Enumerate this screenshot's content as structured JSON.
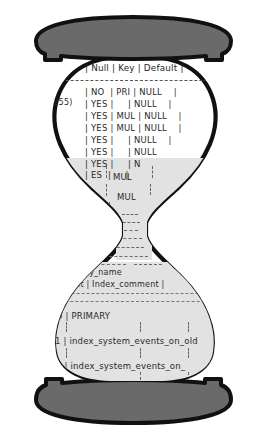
{
  "figure": {
    "colors": {
      "cap": "#6a6a6a",
      "outline": "#111111",
      "sand": "#e2e2e2",
      "background": "#ffffff",
      "text": "#2a2a2a"
    }
  },
  "top_bulb": {
    "header": "| Null | Key | Default |",
    "left_fragments": [
      ")",
      "(255)"
    ],
    "rows": [
      "| NO  | PRI | NULL    |",
      "| YES |     | NULL    |",
      "| YES | MUL | NULL    |",
      "| YES | MUL | NULL    |",
      "| YES |     | NULL    |",
      "| YES |     | NULL",
      "| YES |     | N",
      "| ES  |     |",
      "| MUL |",
      "| MUL"
    ],
    "neck_fragments": [
      "MUL",
      "MUL"
    ]
  },
  "bottom_bulb": {
    "header_fragments": [
      "Key_name",
      "ment | Index_comment |"
    ],
    "rows": [
      "0 | PRIMARY",
      "1 | index_system_events_on_old",
      "1 | index_system_events_on_"
    ]
  },
  "caps": {
    "top_label": "top-cap",
    "bottom_label": "bottom-cap"
  }
}
